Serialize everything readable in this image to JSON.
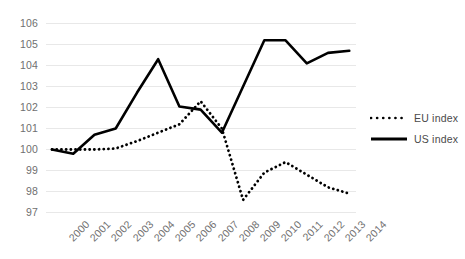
{
  "chart_data": {
    "type": "line",
    "title": "",
    "subtitle": "",
    "xlabel": "",
    "ylabel": "",
    "x": [
      "2000",
      "2001",
      "2002",
      "2003",
      "2004",
      "2005",
      "2006",
      "2007",
      "2008",
      "2009",
      "2010",
      "2011",
      "2012",
      "2013",
      "2014"
    ],
    "categories": [
      "2000",
      "2001",
      "2002",
      "2003",
      "2004",
      "2005",
      "2006",
      "2007",
      "2008",
      "2009",
      "2010",
      "2011",
      "2012",
      "2013",
      "2014"
    ],
    "ylim": [
      97,
      106
    ],
    "yticks": [
      97,
      98,
      99,
      100,
      101,
      102,
      103,
      104,
      105,
      106
    ],
    "grid": true,
    "legend_position": "right",
    "series": [
      {
        "name": "EU index",
        "style": "dotted",
        "color": "#000000",
        "values": [
          100.0,
          100.0,
          100.0,
          100.05,
          100.4,
          100.8,
          101.2,
          102.3,
          101.0,
          97.6,
          98.9,
          99.4,
          98.8,
          98.2,
          97.9
        ]
      },
      {
        "name": "US index",
        "style": "solid",
        "color": "#000000",
        "values": [
          100.0,
          99.8,
          100.7,
          101.0,
          102.7,
          104.3,
          102.05,
          101.9,
          100.8,
          103.0,
          105.2,
          105.2,
          104.1,
          104.6,
          104.7
        ]
      }
    ]
  },
  "legend": {
    "items": [
      {
        "label": "EU index",
        "style": "dotted"
      },
      {
        "label": "US index",
        "style": "solid"
      }
    ]
  },
  "colors": {
    "gridline": "#e8e8e8",
    "tick_text": "#6f6f6f",
    "legend_text": "#4a4a4a",
    "series_line": "#000000",
    "background": "#ffffff"
  }
}
